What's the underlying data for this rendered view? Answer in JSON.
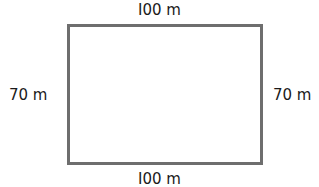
{
  "diagram": {
    "shape": "rectangle",
    "stroke_color": "#6e6e6e",
    "labels": {
      "top": "I00 m",
      "bottom": "I00 m",
      "left": "70 m",
      "right": "70 m"
    },
    "dimensions": {
      "length": "100 m",
      "width": "70 m"
    }
  }
}
